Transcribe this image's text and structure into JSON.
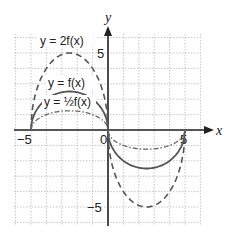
{
  "chart_data": {
    "type": "line",
    "title": "",
    "xlabel": "x",
    "ylabel": "y",
    "xlim": [
      -6,
      6
    ],
    "ylim": [
      -6,
      6
    ],
    "grid": true,
    "tick_labels": {
      "x": [
        "-5",
        "0",
        "5"
      ],
      "y": [
        "5",
        "-5"
      ]
    },
    "series": [
      {
        "name": "y = 2f(x)",
        "style": "dashed",
        "x": [
          -5,
          -4,
          -3,
          -2.5,
          -2,
          -1,
          0,
          1,
          2,
          2.5,
          3,
          4,
          5
        ],
        "y": [
          0,
          4,
          4.9,
          5,
          4.9,
          4,
          0,
          -4,
          -4.9,
          -5,
          -4.9,
          -4,
          0
        ]
      },
      {
        "name": "y = f(x)",
        "style": "solid",
        "x": [
          -5,
          -4,
          -3,
          -2.5,
          -2,
          -1,
          0,
          1,
          2,
          2.5,
          3,
          4,
          5
        ],
        "y": [
          0,
          2,
          2.45,
          2.5,
          2.45,
          2,
          0,
          -2,
          -2.45,
          -2.5,
          -2.45,
          -2,
          0
        ]
      },
      {
        "name": "y = ½f(x)",
        "style": "dash-dot",
        "x": [
          -5,
          -4,
          -3,
          -2.5,
          -2,
          -1,
          0,
          1,
          2,
          2.5,
          3,
          4,
          5
        ],
        "y": [
          0,
          1,
          1.22,
          1.25,
          1.22,
          1,
          0,
          -1,
          -1.22,
          -1.25,
          -1.22,
          -1,
          0
        ]
      }
    ]
  },
  "labels": {
    "x_axis": "x",
    "y_axis": "y",
    "tick_x_neg5": "−5",
    "tick_x_0": "0",
    "tick_x_5": "5",
    "tick_y_5": "5",
    "tick_y_neg5": "−5",
    "eq_2f": "y = 2f(x)",
    "eq_f": "y = f(x)",
    "eq_half_f": "y = ½f(x)"
  }
}
